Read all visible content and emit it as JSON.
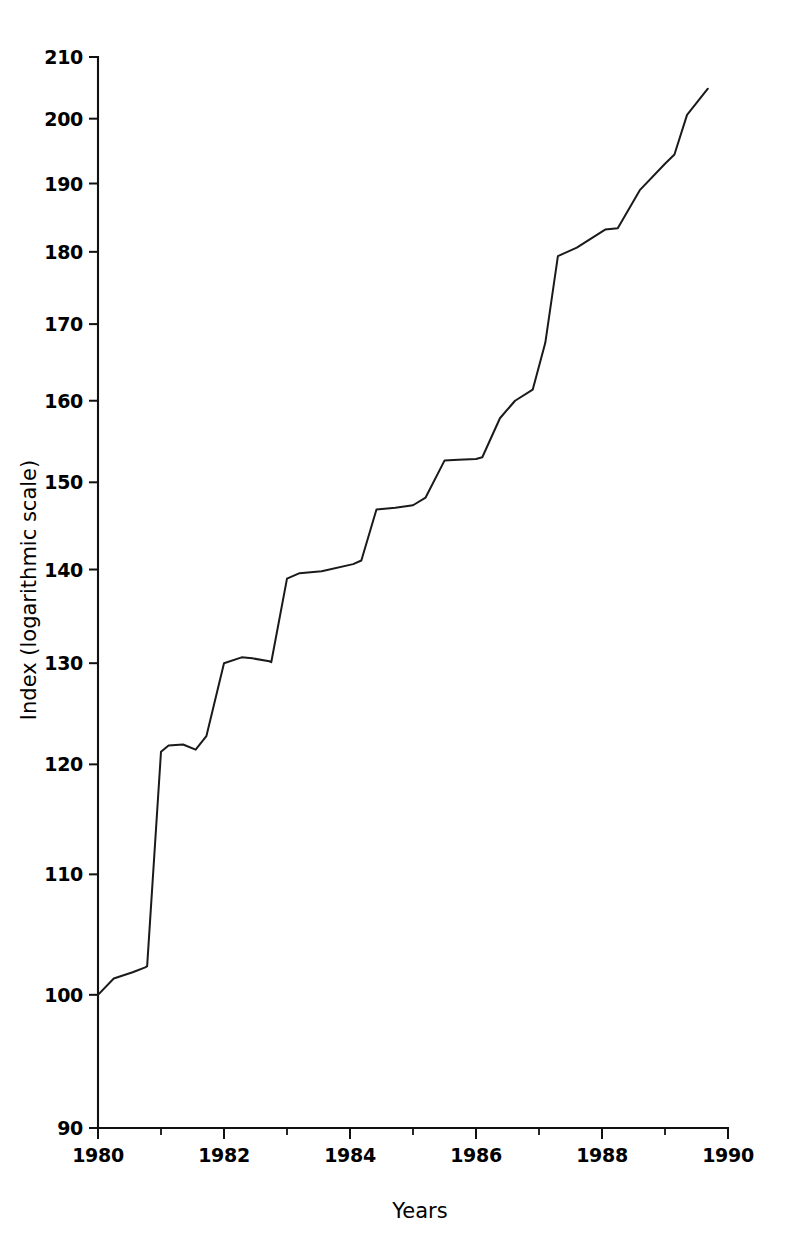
{
  "chart_data": {
    "type": "line",
    "title": "",
    "xlabel": "Years",
    "ylabel": "Index (logarithmic scale)",
    "yscale": "log",
    "xscale": "linear",
    "xlim": [
      1980,
      1990
    ],
    "ylim": [
      90,
      210
    ],
    "grid": false,
    "legend": null,
    "y_ticks": [
      90,
      100,
      110,
      120,
      130,
      140,
      150,
      160,
      170,
      180,
      190,
      200,
      210
    ],
    "y_tick_labels": [
      "90",
      "100",
      "110",
      "120",
      "130",
      "140",
      "150",
      "160",
      "170",
      "180",
      "190",
      "200",
      "210"
    ],
    "x_ticks_major": [
      1980,
      1982,
      1984,
      1986,
      1988,
      1990
    ],
    "x_tick_labels": [
      "1980",
      "1982",
      "1984",
      "1986",
      "1988",
      "1990"
    ],
    "x_ticks_minor": [
      1981,
      1983,
      1985,
      1987,
      1989
    ],
    "series": [
      {
        "name": "Index",
        "x": [
          1980.0,
          1980.25,
          1980.55,
          1980.75,
          1980.78,
          1981.0,
          1981.12,
          1981.35,
          1981.55,
          1981.72,
          1982.0,
          1982.28,
          1982.45,
          1982.72,
          1982.75,
          1983.0,
          1983.2,
          1983.55,
          1984.05,
          1984.18,
          1984.42,
          1984.72,
          1985.0,
          1985.2,
          1985.5,
          1985.72,
          1986.0,
          1986.1,
          1986.38,
          1986.62,
          1986.9,
          1987.1,
          1987.3,
          1987.6,
          1988.05,
          1988.25,
          1988.6,
          1989.0,
          1989.15,
          1989.35,
          1989.68
        ],
        "y": [
          100.0,
          101.3,
          101.8,
          102.2,
          102.3,
          121.2,
          121.8,
          121.9,
          121.4,
          122.7,
          130.0,
          130.6,
          130.5,
          130.2,
          130.1,
          139.0,
          139.6,
          139.8,
          140.6,
          141.0,
          146.8,
          147.0,
          147.3,
          148.2,
          152.6,
          152.7,
          152.8,
          153.0,
          157.8,
          160.0,
          161.4,
          167.5,
          179.4,
          180.6,
          183.2,
          183.4,
          189.0,
          193.0,
          194.4,
          200.6,
          204.8
        ]
      }
    ]
  },
  "axis": {
    "y_title": "Index (logarithmic scale)",
    "x_title": "Years"
  }
}
